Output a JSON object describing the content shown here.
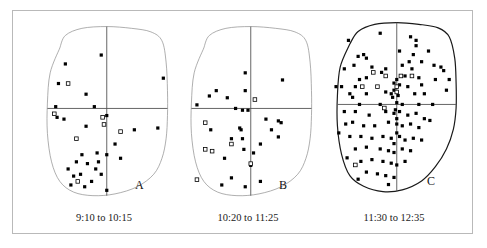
{
  "figure": {
    "type": "scatter-panels",
    "panel_count": 3,
    "frame_color": "#b9b9b9",
    "marker_colors": {
      "filled_square": "#000000",
      "open_square_stroke": "#000000",
      "open_square_fill": "#ffffff"
    },
    "axis_color": "#555555",
    "outline_color_light": "#8d8d8d",
    "outline_color_dark": "#1a1a1a"
  },
  "chart_data": [
    {
      "type": "scatter",
      "panel_label": "A",
      "title": "9:10 to 10:15",
      "xlabel": "",
      "ylabel": "",
      "xlim": [
        0,
        100
      ],
      "ylim": [
        0,
        100
      ],
      "grid": false,
      "legend": "none",
      "axes_crosshair": {
        "x": 52,
        "y": 52
      },
      "boundary": [
        [
          18,
          86
        ],
        [
          22,
          93
        ],
        [
          34,
          97
        ],
        [
          52,
          98
        ],
        [
          70,
          97
        ],
        [
          84,
          95
        ],
        [
          92,
          90
        ],
        [
          95,
          78
        ],
        [
          96,
          62
        ],
        [
          96,
          48
        ],
        [
          95,
          35
        ],
        [
          92,
          24
        ],
        [
          86,
          15
        ],
        [
          74,
          8
        ],
        [
          58,
          4
        ],
        [
          42,
          3
        ],
        [
          28,
          5
        ],
        [
          18,
          11
        ],
        [
          12,
          22
        ],
        [
          9,
          38
        ],
        [
          9,
          55
        ],
        [
          11,
          72
        ],
        [
          18,
          86
        ]
      ],
      "series": [
        {
          "name": "filled",
          "marker": "filled-square",
          "points": [
            [
              22,
              77
            ],
            [
              17,
              66
            ],
            [
              48,
              82
            ],
            [
              93,
              69
            ],
            [
              37,
              60
            ],
            [
              15,
              53
            ],
            [
              16,
              47
            ],
            [
              21,
              46
            ],
            [
              43,
              53
            ],
            [
              52,
              48
            ],
            [
              37,
              42
            ],
            [
              72,
              40
            ],
            [
              89,
              41
            ],
            [
              34,
              26
            ],
            [
              45,
              27
            ],
            [
              52,
              26
            ],
            [
              30,
              22
            ],
            [
              38,
              21
            ],
            [
              24,
              18
            ],
            [
              44,
              18
            ],
            [
              33,
              15
            ],
            [
              48,
              15
            ],
            [
              58,
              32
            ],
            [
              62,
              24
            ],
            [
              41,
              11
            ],
            [
              26,
              9
            ],
            [
              36,
              8
            ],
            [
              52,
              6
            ],
            [
              46,
              22
            ],
            [
              28,
              14
            ]
          ]
        },
        {
          "name": "open",
          "marker": "open-square",
          "points": [
            [
              24,
              66
            ],
            [
              14,
              49
            ],
            [
              49,
              47
            ],
            [
              50,
              43
            ],
            [
              62,
              39
            ],
            [
              30,
              35
            ],
            [
              31,
              11
            ]
          ]
        }
      ],
      "counts": {
        "filled": 30,
        "open": 7
      }
    },
    {
      "type": "scatter",
      "panel_label": "B",
      "title": "10:20 to 11:25",
      "xlabel": "",
      "ylabel": "",
      "xlim": [
        0,
        100
      ],
      "ylim": [
        0,
        100
      ],
      "grid": false,
      "legend": "none",
      "axes_crosshair": {
        "x": 52,
        "y": 52
      },
      "boundary": [
        [
          18,
          86
        ],
        [
          22,
          93
        ],
        [
          34,
          97
        ],
        [
          52,
          98
        ],
        [
          70,
          97
        ],
        [
          84,
          95
        ],
        [
          92,
          90
        ],
        [
          95,
          78
        ],
        [
          96,
          62
        ],
        [
          96,
          48
        ],
        [
          95,
          35
        ],
        [
          92,
          24
        ],
        [
          86,
          15
        ],
        [
          74,
          8
        ],
        [
          58,
          4
        ],
        [
          42,
          3
        ],
        [
          28,
          5
        ],
        [
          18,
          11
        ],
        [
          12,
          22
        ],
        [
          9,
          38
        ],
        [
          9,
          55
        ],
        [
          11,
          72
        ],
        [
          18,
          86
        ]
      ],
      "series": [
        {
          "name": "filled",
          "marker": "filled-square",
          "points": [
            [
              48,
              72
            ],
            [
              75,
              68
            ],
            [
              27,
              62
            ],
            [
              22,
              59
            ],
            [
              48,
              62
            ],
            [
              35,
              58
            ],
            [
              13,
              54
            ],
            [
              41,
              52
            ],
            [
              46,
              51
            ],
            [
              50,
              51
            ],
            [
              63,
              46
            ],
            [
              72,
              45
            ],
            [
              74,
              44
            ],
            [
              67,
              40
            ],
            [
              44,
              41
            ],
            [
              45,
              40
            ],
            [
              23,
              40
            ],
            [
              38,
              35
            ],
            [
              46,
              35
            ],
            [
              72,
              36
            ],
            [
              59,
              32
            ],
            [
              47,
              29
            ],
            [
              54,
              27
            ],
            [
              33,
              24
            ],
            [
              52,
              20
            ],
            [
              38,
              13
            ],
            [
              59,
              11
            ],
            [
              48,
              8
            ],
            [
              31,
              9
            ]
          ]
        },
        {
          "name": "open",
          "marker": "open-square",
          "points": [
            [
              55,
              57
            ],
            [
              19,
              44
            ],
            [
              19,
              29
            ],
            [
              38,
              32
            ],
            [
              24,
              28
            ],
            [
              13,
              12
            ],
            [
              52,
              21
            ]
          ]
        }
      ],
      "counts": {
        "filled": 29,
        "open": 7
      }
    },
    {
      "type": "scatter",
      "panel_label": "C",
      "title": "11:30 to 12:35",
      "xlabel": "",
      "ylabel": "",
      "xlim": [
        0,
        100
      ],
      "ylim": [
        0,
        100
      ],
      "grid": false,
      "legend": "none",
      "axes_crosshair": {
        "x": 52,
        "y": 52
      },
      "boundary": [
        [
          18,
          86
        ],
        [
          24,
          93
        ],
        [
          36,
          97
        ],
        [
          52,
          98
        ],
        [
          68,
          97
        ],
        [
          82,
          95
        ],
        [
          90,
          90
        ],
        [
          94,
          78
        ],
        [
          95,
          64
        ],
        [
          95,
          50
        ],
        [
          93,
          38
        ],
        [
          88,
          27
        ],
        [
          80,
          17
        ],
        [
          70,
          9
        ],
        [
          56,
          4
        ],
        [
          42,
          3
        ],
        [
          28,
          6
        ],
        [
          18,
          12
        ],
        [
          12,
          24
        ],
        [
          9,
          40
        ],
        [
          9,
          57
        ],
        [
          11,
          73
        ],
        [
          18,
          86
        ]
      ],
      "series": [
        {
          "name": "filled",
          "marker": "filled-square",
          "points": [
            [
              17,
              88
            ],
            [
              40,
              92
            ],
            [
              62,
              90
            ],
            [
              66,
              88
            ],
            [
              66,
              85
            ],
            [
              24,
              79
            ],
            [
              28,
              80
            ],
            [
              30,
              78
            ],
            [
              54,
              82
            ],
            [
              64,
              80
            ],
            [
              61,
              76
            ],
            [
              70,
              76
            ],
            [
              75,
              82
            ],
            [
              14,
              72
            ],
            [
              21,
              74
            ],
            [
              34,
              73
            ],
            [
              44,
              72
            ],
            [
              56,
              74
            ],
            [
              63,
              72
            ],
            [
              79,
              74
            ],
            [
              84,
              73
            ],
            [
              86,
              71
            ],
            [
              25,
              66
            ],
            [
              30,
              67
            ],
            [
              41,
              70
            ],
            [
              58,
              68
            ],
            [
              68,
              67
            ],
            [
              80,
              66
            ],
            [
              90,
              66
            ],
            [
              8,
              62
            ],
            [
              12,
              62
            ],
            [
              22,
              62
            ],
            [
              50,
              64
            ],
            [
              54,
              63
            ],
            [
              60,
              62
            ],
            [
              70,
              63
            ],
            [
              88,
              60
            ],
            [
              18,
              58
            ],
            [
              20,
              56
            ],
            [
              30,
              58
            ],
            [
              44,
              59
            ],
            [
              48,
              58
            ],
            [
              49,
              56
            ],
            [
              50,
              60
            ],
            [
              65,
              58
            ],
            [
              72,
              58
            ],
            [
              25,
              52
            ],
            [
              40,
              52
            ],
            [
              52,
              53
            ],
            [
              56,
              52
            ],
            [
              68,
              52
            ],
            [
              78,
              52
            ],
            [
              14,
              48
            ],
            [
              22,
              48
            ],
            [
              32,
              46
            ],
            [
              44,
              48
            ],
            [
              50,
              47
            ],
            [
              54,
              48
            ],
            [
              60,
              46
            ],
            [
              66,
              47
            ],
            [
              72,
              44
            ],
            [
              76,
              43
            ],
            [
              15,
              41
            ],
            [
              20,
              42
            ],
            [
              28,
              40
            ],
            [
              36,
              40
            ],
            [
              46,
              42
            ],
            [
              52,
              41
            ],
            [
              56,
              40
            ],
            [
              62,
              41
            ],
            [
              68,
              39
            ],
            [
              10,
              36
            ],
            [
              18,
              34
            ],
            [
              26,
              34
            ],
            [
              34,
              33
            ],
            [
              42,
              34
            ],
            [
              48,
              33
            ],
            [
              54,
              34
            ],
            [
              58,
              32
            ],
            [
              64,
              33
            ],
            [
              70,
              32
            ],
            [
              22,
              27
            ],
            [
              30,
              28
            ],
            [
              40,
              27
            ],
            [
              46,
              26
            ],
            [
              50,
              25
            ],
            [
              56,
              27
            ],
            [
              62,
              26
            ],
            [
              16,
              22
            ],
            [
              26,
              20
            ],
            [
              34,
              21
            ],
            [
              42,
              20
            ],
            [
              48,
              19
            ],
            [
              52,
              18
            ],
            [
              58,
              20
            ],
            [
              30,
              14
            ],
            [
              38,
              13
            ],
            [
              44,
              12
            ],
            [
              50,
              11
            ],
            [
              24,
              10
            ],
            [
              46,
              7
            ],
            [
              50,
              30
            ],
            [
              52,
              36
            ],
            [
              52,
              44
            ],
            [
              51,
              49
            ],
            [
              53,
              57
            ],
            [
              52,
              66
            ]
          ]
        },
        {
          "name": "open",
          "marker": "open-square",
          "points": [
            [
              35,
              70
            ],
            [
              27,
              62
            ],
            [
              38,
              62
            ],
            [
              44,
              68
            ],
            [
              55,
              68
            ],
            [
              63,
              68
            ],
            [
              52,
              59
            ],
            [
              43,
              50
            ],
            [
              22,
              18
            ],
            [
              52,
              62
            ]
          ]
        }
      ],
      "counts": {
        "filled": 107,
        "open": 10
      }
    }
  ],
  "panels": [
    {
      "letter": "A",
      "caption": "9:10 to 10:15"
    },
    {
      "letter": "B",
      "caption": "10:20 to 11:25"
    },
    {
      "letter": "C",
      "caption": "11:30 to 12:35"
    }
  ]
}
